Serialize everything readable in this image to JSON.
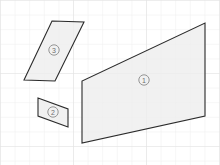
{
  "diagram": {
    "background_color": "#ffffff",
    "grid": {
      "visible": true,
      "cell_size_px": 14.6,
      "line_color": "#ebebeb",
      "major_line_color": "#e2e2e2"
    },
    "style": {
      "fill_color": "#ededed",
      "stroke_color": "#2b2b2b",
      "label_color": "#6f6f6f",
      "label_circle_color": "#8a8a8a"
    },
    "shapes": [
      {
        "id": "shape-3",
        "name": "upper-left-parallelogram",
        "label": "3",
        "label_display": "③",
        "label_x": 54,
        "label_y": 50,
        "label_radius": 5.2,
        "points": "52,21 84,22 55,81 24,80"
      },
      {
        "id": "shape-2",
        "name": "lower-left-parallelogram",
        "label": "2",
        "label_display": "②",
        "label_x": 53,
        "label_y": 112,
        "label_radius": 5.2,
        "points": "38,98 68,109 68,127 38,116"
      },
      {
        "id": "shape-1",
        "name": "large-right-parallelogram",
        "label": "1",
        "label_display": "①",
        "label_x": 144,
        "label_y": 80,
        "label_radius": 5.2,
        "points": "205,23 205,116 82,143 82,81"
      }
    ]
  }
}
